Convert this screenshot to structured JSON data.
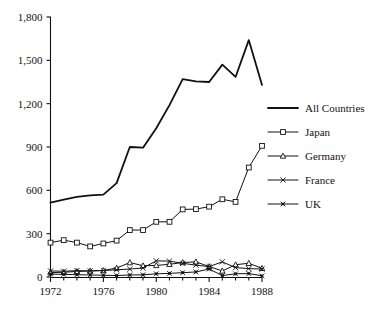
{
  "chart_data": {
    "type": "line",
    "title": "",
    "subtitle": "",
    "xlabel": "",
    "ylabel": "",
    "x": [
      1972,
      1973,
      1974,
      1975,
      1976,
      1977,
      1978,
      1979,
      1980,
      1981,
      1982,
      1983,
      1984,
      1985,
      1986,
      1987,
      1988
    ],
    "xlim": [
      1972,
      1988
    ],
    "ylim": [
      0,
      1800
    ],
    "xticks": [
      1972,
      1976,
      1980,
      1984,
      1988
    ],
    "xticklabels": [
      "1972",
      "1976",
      "1980",
      "1984",
      "1988"
    ],
    "yticks": [
      0,
      300,
      600,
      900,
      1200,
      1500,
      1800
    ],
    "yticklabels": [
      "0",
      "300",
      "600",
      "900",
      "1,200",
      "1,500",
      "1,800"
    ],
    "grid": false,
    "legend_position": "right",
    "series": [
      {
        "name": "All Countries",
        "marker": "none",
        "color": "#111111",
        "linewidth": 1.8,
        "values": [
          515,
          535,
          555,
          565,
          570,
          650,
          900,
          895,
          1030,
          1190,
          1370,
          1355,
          1350,
          1470,
          1385,
          1640,
          1330
        ]
      },
      {
        "name": "Japan",
        "marker": "open-square",
        "color": "#111111",
        "linewidth": 1.0,
        "values": [
          238,
          255,
          238,
          212,
          232,
          252,
          325,
          325,
          382,
          382,
          468,
          470,
          487,
          538,
          520,
          758,
          908
        ]
      },
      {
        "name": "Germany",
        "marker": "open-triangle",
        "color": "#111111",
        "linewidth": 1.0,
        "values": [
          30,
          33,
          38,
          42,
          45,
          62,
          100,
          78,
          80,
          88,
          100,
          105,
          72,
          42,
          85,
          95,
          60
        ]
      },
      {
        "name": "France",
        "marker": "cross-x",
        "color": "#111111",
        "linewidth": 1.0,
        "values": [
          42,
          40,
          44,
          42,
          45,
          50,
          55,
          62,
          112,
          110,
          95,
          82,
          72,
          105,
          65,
          58,
          55
        ]
      },
      {
        "name": "UK",
        "marker": "solid-star",
        "color": "#111111",
        "linewidth": 1.0,
        "values": [
          20,
          18,
          16,
          14,
          12,
          10,
          14,
          15,
          22,
          25,
          30,
          35,
          55,
          10,
          22,
          24,
          8
        ]
      }
    ]
  },
  "axes": {
    "y_axis_name": "y-axis",
    "x_axis_name": "x-axis"
  },
  "legend": {
    "entries": [
      {
        "label": "All Countries",
        "marker": "none"
      },
      {
        "label": "Japan",
        "marker": "open-square"
      },
      {
        "label": "Germany",
        "marker": "open-triangle"
      },
      {
        "label": "France",
        "marker": "cross-x"
      },
      {
        "label": "UK",
        "marker": "solid-star"
      }
    ]
  }
}
